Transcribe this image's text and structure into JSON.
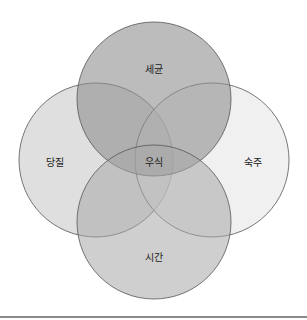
{
  "diagram": {
    "type": "venn",
    "sets": [
      {
        "id": "top",
        "label": "세균",
        "cx": 154,
        "cy": 99,
        "r": 77,
        "fill": "#9a9a9a",
        "opacity": 0.55
      },
      {
        "id": "left",
        "label": "당질",
        "cx": 96,
        "cy": 160,
        "r": 77,
        "fill": "#bdbdbd",
        "opacity": 0.5
      },
      {
        "id": "right",
        "label": "숙주",
        "cx": 212,
        "cy": 160,
        "r": 77,
        "fill": "#e6e6e6",
        "opacity": 0.5
      },
      {
        "id": "bottom",
        "label": "시간",
        "cx": 154,
        "cy": 222,
        "r": 77,
        "fill": "#b0b0b0",
        "opacity": 0.55
      }
    ],
    "center_label": "우식",
    "stroke_color": "#555555",
    "labels": {
      "top": "세균",
      "left": "당질",
      "right": "숙주",
      "bottom": "시간",
      "center": "우식"
    }
  }
}
